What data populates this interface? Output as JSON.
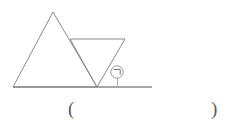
{
  "figure": {
    "stroke_color": "#8a8a8a",
    "background_color": "#ffffff",
    "baseline": {
      "name": "base-line",
      "x1": 13,
      "y1": 87,
      "x2": 152,
      "y2": 87
    },
    "upward_triangle": {
      "name": "upward-triangle",
      "points": "13,87 53,12 97,87",
      "vertices": [
        {
          "label": "bottom-left",
          "x": 13,
          "y": 87
        },
        {
          "label": "apex",
          "x": 53,
          "y": 12
        },
        {
          "label": "bottom-right",
          "x": 97,
          "y": 87
        }
      ]
    },
    "inverted_triangle": {
      "name": "inverted-triangle",
      "points": "70,39 125,39 97,87",
      "vertices": [
        {
          "label": "top-left",
          "x": 70,
          "y": 39
        },
        {
          "label": "top-right",
          "x": 125,
          "y": 39
        },
        {
          "label": "bottom-apex",
          "x": 97,
          "y": 87
        }
      ]
    },
    "angle_marker": {
      "name": "angle-arc",
      "arc_path": "M 114.5 71.0 A 20 20 0 0 1 117 87",
      "vertex_x": 97,
      "vertex_y": 87
    },
    "angle_label": {
      "name": "angle-label-circled-giyeok",
      "text": "㉠",
      "x": 117,
      "y": 75
    }
  },
  "answer": {
    "open_paren": "(",
    "close_paren": ")",
    "value": ""
  }
}
